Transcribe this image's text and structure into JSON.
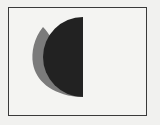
{
  "figure": {
    "type": "diagram",
    "frame": {
      "x": 8,
      "y": 7,
      "width": 139,
      "height": 109,
      "stroke": "#3a3a3a"
    },
    "shapes": [
      {
        "name": "grey-lens",
        "fill": "#7b7b7b"
      },
      {
        "name": "dark-half-disk",
        "fill": "#222222",
        "center": [
          83,
          57
        ],
        "radius": 40
      }
    ],
    "background": "#f1f1ef"
  }
}
